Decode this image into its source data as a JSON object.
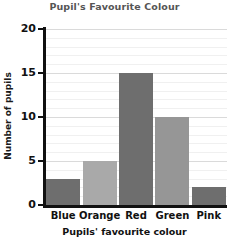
{
  "chart_data": {
    "type": "bar",
    "title": "Pupil's Favourite Colour",
    "xlabel": "Pupils' favourite colour",
    "ylabel": "Number of pupils",
    "categories": [
      "Blue",
      "Orange",
      "Red",
      "Green",
      "Pink"
    ],
    "values": [
      3,
      5,
      15,
      10,
      2
    ],
    "ylim": [
      0,
      20
    ],
    "yticks": [
      0,
      5,
      10,
      15,
      20
    ],
    "ytick_labels": [
      "0",
      "5",
      "10",
      "15",
      "20"
    ],
    "minor_gridlines": true,
    "minor_tick_step": 1,
    "grid": true,
    "legend": false,
    "bar_colors": [
      "#6e6e6e",
      "#a9a9a9",
      "#6e6e6e",
      "#969696",
      "#6e6e6e"
    ]
  }
}
